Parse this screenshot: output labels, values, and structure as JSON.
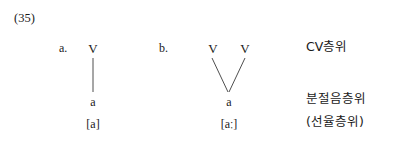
{
  "example": {
    "number": "(35)"
  },
  "panels": [
    {
      "letter": "a.",
      "cv_nodes": [
        "V"
      ],
      "segment": "a",
      "transcription": "[a]"
    },
    {
      "letter": "b.",
      "cv_nodes": [
        "V",
        "V"
      ],
      "segment": "a",
      "transcription": "[aː]"
    }
  ],
  "tier_labels": {
    "cv": "CV층위",
    "segmental": "분절음층위",
    "melodic": "(선율층위)"
  },
  "colors": {
    "background": "#ffffff",
    "text": "#1a1a1a",
    "line": "#3a3a3a"
  }
}
